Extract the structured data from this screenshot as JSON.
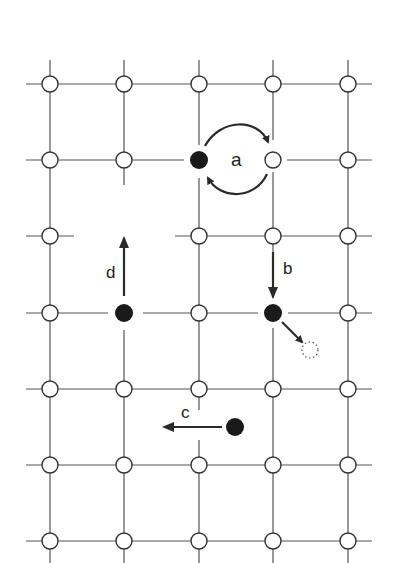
{
  "diagram": {
    "type": "crystal-lattice-diffusion-mechanisms",
    "colors": {
      "line": "#555555",
      "atom_open_fill": "#ffffff",
      "atom_open_stroke": "#333333",
      "atom_filled": "#1a1a1a",
      "arrow": "#2a2a2a"
    },
    "grid": {
      "columns_x": [
        50,
        124,
        199,
        273,
        348
      ],
      "rows_y": [
        84,
        160,
        236,
        313,
        389,
        465,
        541
      ]
    },
    "labels": {
      "a": "a",
      "b": "b",
      "c": "c",
      "d": "d"
    },
    "mechanisms": [
      {
        "id": "a",
        "name": "exchange / ring rotation between filled and open atom",
        "label": "a"
      },
      {
        "id": "b",
        "name": "atom moves down into lattice site then to interstitial",
        "label": "b"
      },
      {
        "id": "c",
        "name": "interstitial atom moves left",
        "label": "c"
      },
      {
        "id": "d",
        "name": "atom moves up into vacancy",
        "label": "d"
      }
    ]
  }
}
